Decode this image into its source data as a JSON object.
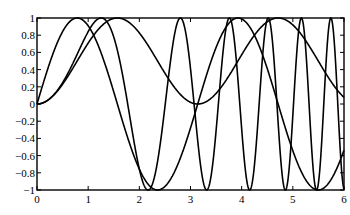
{
  "chart_data": {
    "type": "line",
    "title": "",
    "xlabel": "",
    "ylabel": "",
    "xlim": [
      0,
      6
    ],
    "ylim": [
      -1,
      1
    ],
    "grid": false,
    "legend": null,
    "x_ticks": [
      0,
      1,
      2,
      3,
      4,
      5,
      6
    ],
    "x_tick_labels": [
      "0",
      "1",
      "2",
      "3",
      "4",
      "5",
      "6"
    ],
    "y_ticks": [
      -1,
      -0.8,
      -0.6,
      -0.4,
      -0.2,
      0,
      0.2,
      0.4,
      0.6,
      0.8,
      1
    ],
    "y_tick_labels": [
      "−1",
      "−0.8",
      "−0.6",
      "−0.4",
      "−0.2",
      "0",
      "0.2",
      "0.4",
      "0.6",
      "0.8",
      "1"
    ],
    "line_color": "#000000",
    "series": [
      {
        "name": "sin(2x)",
        "expr": "sin(2*x)",
        "x": [
          0,
          0.5,
          0.785,
          1,
          1.5,
          1.571,
          2,
          2.356,
          2.5,
          3,
          3.142,
          3.5,
          3.927,
          4,
          4.5,
          4.712,
          5,
          5.498,
          6
        ],
        "values": [
          0,
          0.841,
          1,
          0.909,
          0.141,
          0,
          -0.757,
          -1,
          -0.959,
          -0.279,
          0,
          0.657,
          1,
          0.989,
          0.412,
          0,
          -0.544,
          -1,
          -0.537
        ]
      },
      {
        "name": "sin(x^2)",
        "expr": "sin(x*x)",
        "x": [
          0,
          0.5,
          1,
          1.253,
          1.5,
          1.772,
          2,
          2.171,
          2.5,
          2.802,
          3,
          3.07,
          3.5,
          3.963,
          4,
          4.5,
          5,
          5.5,
          6
        ],
        "values": [
          0,
          0.247,
          0.841,
          1,
          0.778,
          0,
          -0.757,
          -1,
          0.034,
          1,
          0.412,
          0,
          -0.311,
          0,
          -0.288,
          0.974,
          -0.132,
          -0.993,
          -0.992
        ]
      },
      {
        "name": "sin(x)^2",
        "expr": "sin(x)*sin(x)",
        "x": [
          0,
          0.5,
          1,
          1.571,
          2,
          2.5,
          3,
          3.142,
          3.5,
          4,
          4.712,
          5,
          5.5,
          6
        ],
        "values": [
          0,
          0.23,
          0.708,
          1,
          0.827,
          0.358,
          0.02,
          0,
          0.123,
          0.573,
          1,
          0.919,
          0.498,
          0.078
        ]
      }
    ]
  }
}
